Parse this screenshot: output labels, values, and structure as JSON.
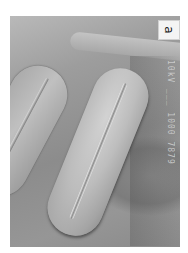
{
  "figure": {
    "panel_label": "a",
    "scale_bar_text": "10kV  ___  1000 7879",
    "colors": {
      "background": "#ffffff",
      "micrograph_mid": "#9d9d9d",
      "grain_highlight": "#d2d2d2",
      "label_box": "#f4f4f4"
    }
  }
}
